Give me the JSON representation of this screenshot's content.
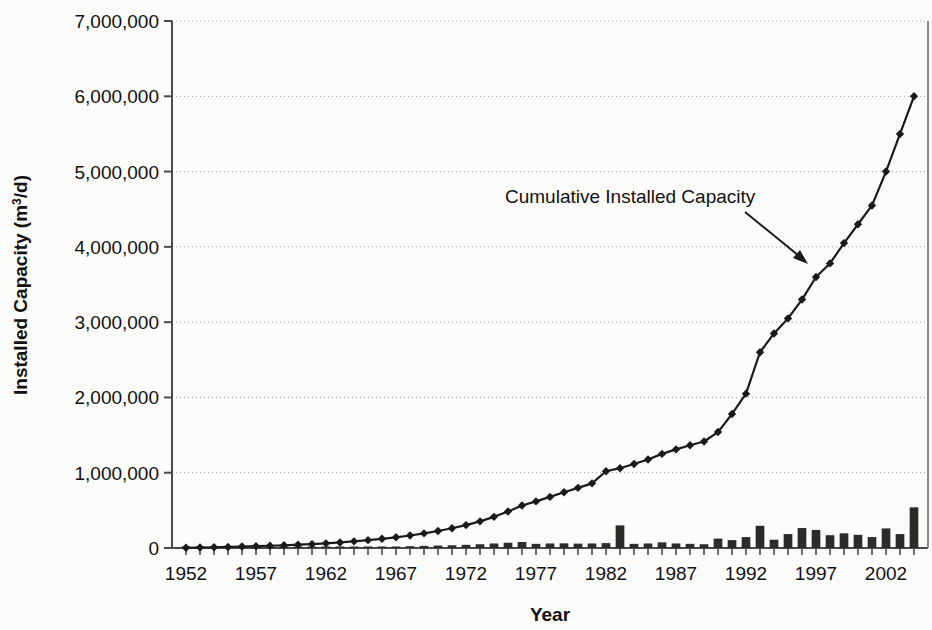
{
  "chart_data": {
    "type": "bar",
    "title": "",
    "xlabel": "Year",
    "ylabel": "Installed Capacity (m3/d)",
    "ylabel_prefix": "Installed Capacity (m",
    "ylabel_sup": "3",
    "ylabel_suffix": "/d)",
    "annotation": "Cumulative Installed Capacity",
    "grid": true,
    "legend_position": "none",
    "xlim": [
      1951.0,
      2005.0
    ],
    "ylim": [
      0,
      7000000
    ],
    "ytick_labels": [
      "0",
      "1,000,000",
      "2,000,000",
      "3,000,000",
      "4,000,000",
      "5,000,000",
      "6,000,000",
      "7,000,000"
    ],
    "ytick_values": [
      0,
      1000000,
      2000000,
      3000000,
      4000000,
      5000000,
      6000000,
      7000000
    ],
    "xtick_labels": [
      "1952",
      "1957",
      "1962",
      "1967",
      "1972",
      "1977",
      "1982",
      "1987",
      "1992",
      "1997",
      "2002"
    ],
    "xtick_values": [
      1952,
      1957,
      1962,
      1967,
      1972,
      1977,
      1982,
      1987,
      1992,
      1997,
      2002
    ],
    "x": [
      1952,
      1953,
      1954,
      1955,
      1956,
      1957,
      1958,
      1959,
      1960,
      1961,
      1962,
      1963,
      1964,
      1965,
      1966,
      1967,
      1968,
      1969,
      1970,
      1971,
      1972,
      1973,
      1974,
      1975,
      1976,
      1977,
      1978,
      1979,
      1980,
      1981,
      1982,
      1983,
      1984,
      1985,
      1986,
      1987,
      1988,
      1989,
      1990,
      1991,
      1992,
      1993,
      1994,
      1995,
      1996,
      1997,
      1998,
      1999,
      2000,
      2001,
      2002,
      2003,
      2004
    ],
    "series": [
      {
        "name": "Annual Installed Capacity",
        "type": "bar",
        "values": [
          3000,
          3000,
          4000,
          4000,
          5000,
          5000,
          6000,
          6000,
          8000,
          8000,
          10000,
          12000,
          14000,
          16000,
          18000,
          20000,
          24000,
          28000,
          32000,
          36000,
          42000,
          50000,
          60000,
          70000,
          80000,
          55000,
          60000,
          62000,
          58000,
          60000,
          65000,
          300000,
          55000,
          60000,
          75000,
          60000,
          55000,
          50000,
          125000,
          105000,
          145000,
          295000,
          110000,
          185000,
          265000,
          240000,
          170000,
          195000,
          175000,
          145000,
          260000,
          185000,
          540000
        ]
      },
      {
        "name": "Cumulative Installed Capacity",
        "type": "line",
        "marker": "diamond",
        "values": [
          3000,
          6000,
          10000,
          14000,
          19000,
          24000,
          30000,
          36000,
          44000,
          52000,
          62000,
          74000,
          88000,
          104000,
          122000,
          142000,
          166000,
          194000,
          226000,
          262000,
          304000,
          354000,
          414000,
          484000,
          564000,
          619000,
          679000,
          741000,
          799000,
          859000,
          1020000,
          1060000,
          1115000,
          1175000,
          1250000,
          1310000,
          1365000,
          1415000,
          1540000,
          1780000,
          2050000,
          2600000,
          2850000,
          3050000,
          3300000,
          3600000,
          3780000,
          4050000,
          4300000,
          4550000,
          5000000,
          5500000,
          6000000
        ]
      }
    ],
    "line_color": "#1a1a1a",
    "bar_color": "#2b2b2b",
    "grid_color": "#9a9a9a",
    "axis_color": "#4a4a4a",
    "background_color": "#fbfbfa"
  }
}
